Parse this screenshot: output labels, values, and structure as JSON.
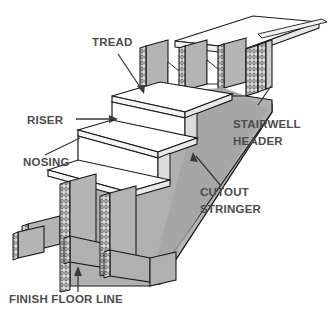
{
  "figure": {
    "background_color": "#ffffff",
    "line_color": "#1a1a1a",
    "label_color": "#4c4c4c",
    "fill_colors": {
      "tread_top": "#ffffff",
      "riser_face": "#ffffff",
      "stringer_face": "#b4b4b4",
      "stringer_shadow": "#a2a2a2",
      "joist_face": "#b4b4b4",
      "floor_top": "#f7f7f7",
      "end_grain": "#d8d8d8"
    }
  },
  "labels": [
    {
      "id": "tread",
      "text": "TREAD",
      "lines": [
        "TREAD"
      ],
      "x": 92,
      "y": 46,
      "anchor": "start",
      "leader": "diagonal-down-right",
      "points_to": "top tread surface"
    },
    {
      "id": "riser",
      "text": "RISER",
      "lines": [
        "RISER"
      ],
      "x": 27,
      "y": 124,
      "anchor": "start",
      "leader": "horizontal-right",
      "points_to": "vertical riser board face"
    },
    {
      "id": "nosing",
      "text": "NOSING",
      "lines": [
        "NOSING"
      ],
      "x": 23,
      "y": 166,
      "anchor": "start",
      "leader": "diagonal-up-right",
      "points_to": "projecting tread nosing edge"
    },
    {
      "id": "stairwell-header",
      "text": "STAIRWELL HEADER",
      "lines": [
        "STAIRWELL",
        "HEADER"
      ],
      "x": 233,
      "y": 128,
      "anchor": "start",
      "leader": "diagonal-up-left",
      "points_to": "doubled header framing the stairwell opening"
    },
    {
      "id": "cutout-stringer",
      "text": "CUTOUT STRINGER",
      "lines": [
        "CUTOUT",
        "STRINGER"
      ],
      "x": 200,
      "y": 196,
      "anchor": "start",
      "leader": "diagonal-up-left",
      "points_to": "sawtooth notched stringer"
    },
    {
      "id": "finish-floor-line",
      "text": "FINISH FLOOR LINE",
      "lines": [
        "FINISH FLOOR LINE"
      ],
      "x": 9,
      "y": 303,
      "anchor": "start",
      "leader": "vertical-up",
      "points_to": "bottom bearing line of the stringer"
    }
  ],
  "components": {
    "tread_count": 3,
    "riser_count": 3,
    "joist_count": 3,
    "has_upper_floor_platform": true,
    "has_end_grain_hatching": true
  }
}
